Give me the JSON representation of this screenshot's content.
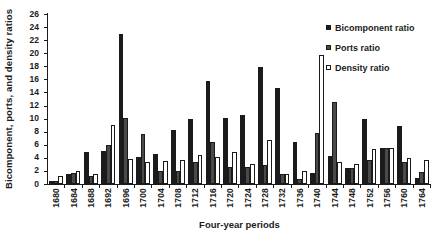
{
  "chart_data": {
    "type": "bar",
    "title": "",
    "xlabel": "Four-year periods",
    "ylabel": "Bicomponent, ports, and density ratios",
    "ylim": [
      0,
      26
    ],
    "ytick_step": 2,
    "grid": false,
    "legend_position": "top-right",
    "background": "#ffffff",
    "axis_color": "#1b1b1b",
    "categories": [
      "1680",
      "1684",
      "1688",
      "1692",
      "1696",
      "1700",
      "1704",
      "1708",
      "1712",
      "1716",
      "1720",
      "1724",
      "1728",
      "1732",
      "1736",
      "1740",
      "1744",
      "1748",
      "1752",
      "1756",
      "1760",
      "1764"
    ],
    "series": [
      {
        "name": "Bicomponent ratio",
        "color": "#1b1b1b",
        "edge": "#1b1b1b",
        "values": [
          0.4,
          1.5,
          4.9,
          5.0,
          23.0,
          4.1,
          4.6,
          8.3,
          9.9,
          15.8,
          10.1,
          10.6,
          17.9,
          14.7,
          6.5,
          1.7,
          4.3,
          2.4,
          9.9,
          5.5,
          8.9,
          0.9
        ]
      },
      {
        "name": "Ports ratio",
        "color": "#4a4a4a",
        "edge": "#1b1b1b",
        "values": [
          0.4,
          1.7,
          1.3,
          6.0,
          10.1,
          7.6,
          2.0,
          2.0,
          3.4,
          6.5,
          2.6,
          2.6,
          2.9,
          1.6,
          0.8,
          7.8,
          12.6,
          2.4,
          3.6,
          5.5,
          3.3,
          1.8
        ]
      },
      {
        "name": "Density ratio",
        "color": "#ffffff",
        "edge": "#1b1b1b",
        "values": [
          1.2,
          2.0,
          1.5,
          9.0,
          3.9,
          3.3,
          3.5,
          3.6,
          4.5,
          4.2,
          4.9,
          3.1,
          6.7,
          1.6,
          2.0,
          19.8,
          3.3,
          3.1,
          5.4,
          5.5,
          4.0,
          3.7
        ]
      }
    ]
  }
}
